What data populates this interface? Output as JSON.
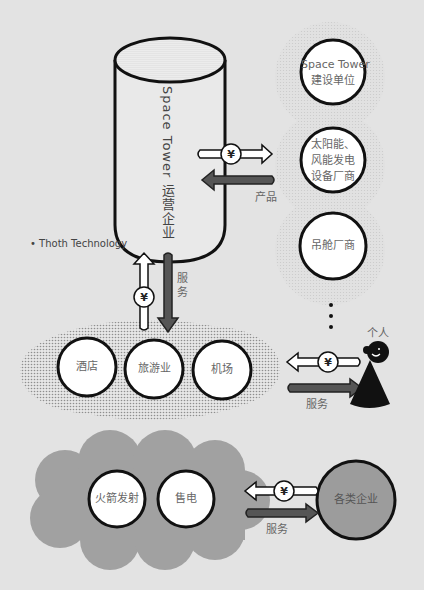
{
  "colors": {
    "background": "#e3e3e3",
    "outline": "#111111",
    "service_arrow": "#555555",
    "cloud_gray": "#a0a0a0",
    "enterprise_circle": "#9c9c9c",
    "dot_pattern": "#999999"
  },
  "tower": {
    "label": "Space Tower 运营企业",
    "source_note": "• Thoth Technology"
  },
  "suppliers": {
    "items": [
      {
        "label_line1": "Space Tower",
        "label_line2": "建设单位"
      },
      {
        "label_line1": "太阳能、",
        "label_line2": "风能发电",
        "label_line3": "设备厂商"
      },
      {
        "label_line1": "吊舱厂商"
      }
    ],
    "ellipsis": "⋮"
  },
  "flows": {
    "yen_symbol": "¥",
    "product_label": "产品",
    "service_label_vertical": "服务",
    "service_label_person": "服务",
    "service_label_enterprise": "服务"
  },
  "tourism_cluster": {
    "items": [
      {
        "label": "酒店"
      },
      {
        "label": "旅游业"
      },
      {
        "label": "机场"
      }
    ]
  },
  "person": {
    "label": "个人",
    "icon": "person-icon"
  },
  "energy_cluster": {
    "items": [
      {
        "label": "火箭发射"
      },
      {
        "label": "售电"
      }
    ]
  },
  "enterprise": {
    "label": "各类企业"
  }
}
